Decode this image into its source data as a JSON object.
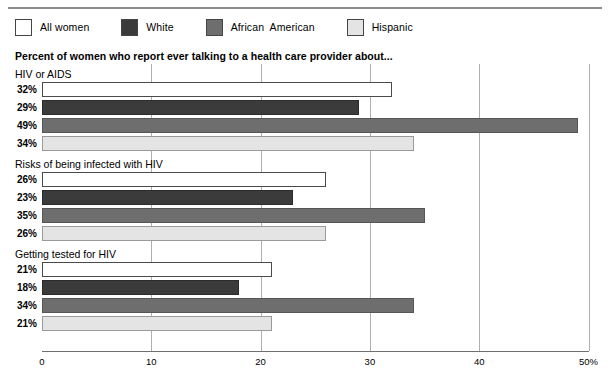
{
  "chart_data": {
    "type": "bar",
    "orientation": "horizontal",
    "title": "",
    "subtitle": "Percent of women who report ever talking to a health care provider about...",
    "xlabel": "",
    "ylabel": "",
    "xlim": [
      0,
      50
    ],
    "xticks": [
      0,
      10,
      20,
      30,
      40,
      50
    ],
    "xticklabels": [
      "0",
      "10",
      "20",
      "30",
      "40",
      "50%"
    ],
    "grid": true,
    "legend_position": "top-left",
    "categories": [
      "HIV or AIDS",
      "Risks of being infected with HIV",
      "Getting tested for HIV"
    ],
    "series": [
      {
        "name": "All women",
        "color": "#ffffff",
        "values": [
          32,
          26,
          21
        ],
        "labels": [
          "32%",
          "26%",
          "21%"
        ]
      },
      {
        "name": "White",
        "color": "#3b3b3b",
        "values": [
          29,
          23,
          18
        ],
        "labels": [
          "29%",
          "23%",
          "18%"
        ]
      },
      {
        "name": "African  American",
        "color": "#6e6e6e",
        "values": [
          49,
          35,
          34
        ],
        "labels": [
          "49%",
          "35%",
          "34%"
        ]
      },
      {
        "name": "Hispanic",
        "color": "#e4e4e4",
        "values": [
          34,
          26,
          21
        ],
        "labels": [
          "34%",
          "26%",
          "21%"
        ]
      }
    ],
    "groups": [
      {
        "label": "HIV or AIDS",
        "bars": [
          {
            "series": "All women",
            "value": 32,
            "label": "32%"
          },
          {
            "series": "White",
            "value": 29,
            "label": "29%"
          },
          {
            "series": "African  American",
            "value": 49,
            "label": "49%"
          },
          {
            "series": "Hispanic",
            "value": 34,
            "label": "34%"
          }
        ]
      },
      {
        "label": "Risks of being infected with HIV",
        "bars": [
          {
            "series": "All women",
            "value": 26,
            "label": "26%"
          },
          {
            "series": "White",
            "value": 23,
            "label": "23%"
          },
          {
            "series": "African  American",
            "value": 35,
            "label": "35%"
          },
          {
            "series": "Hispanic",
            "value": 26,
            "label": "26%"
          }
        ]
      },
      {
        "label": "Getting tested for HIV",
        "bars": [
          {
            "series": "All women",
            "value": 21,
            "label": "21%"
          },
          {
            "series": "White",
            "value": 18,
            "label": "18%"
          },
          {
            "series": "African  American",
            "value": 34,
            "label": "34%"
          },
          {
            "series": "Hispanic",
            "value": 21,
            "label": "21%"
          }
        ]
      }
    ]
  },
  "legend": {
    "items": [
      {
        "label": "All women",
        "color": "#ffffff"
      },
      {
        "label": "White",
        "color": "#3b3b3b"
      },
      {
        "label": "African  American",
        "color": "#6e6e6e"
      },
      {
        "label": "Hispanic",
        "color": "#e4e4e4"
      }
    ]
  },
  "subtitle": "Percent of women who report ever talking to a health care provider about..."
}
